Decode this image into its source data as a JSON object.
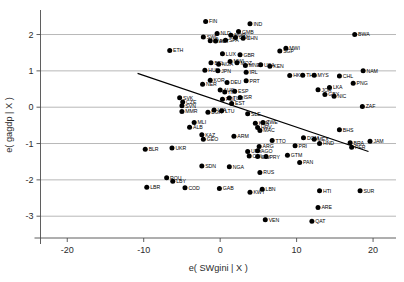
{
  "chart_data": {
    "type": "scatter",
    "title": "",
    "xlabel": "e( SWgini | X )",
    "ylabel": "e( gagdp | X )",
    "xlim": [
      -23.5,
      23.0
    ],
    "ylim": [
      -3.6,
      2.62
    ],
    "xticks": [
      -20,
      -10,
      0,
      10,
      20
    ],
    "xtick_labels": [
      "-20",
      "-10",
      "0",
      "10",
      "20"
    ],
    "yticks": [
      -3,
      -2,
      -1,
      0,
      1,
      2
    ],
    "ytick_labels": [
      "-3",
      "-2",
      "-1",
      "0",
      "1",
      "2"
    ],
    "grid": "horizontal",
    "legend": "none",
    "marker_color": "#000000",
    "fit_line": {
      "label": "linear fit",
      "x_start": -10.8,
      "y_start": 0.93,
      "x_end": 19.4,
      "y_end": -1.22,
      "color": "#000000"
    },
    "points": [
      {
        "label": "FIN",
        "x": -1.9,
        "y": 2.36
      },
      {
        "label": "IND",
        "x": 3.9,
        "y": 2.3
      },
      {
        "label": "NLD",
        "x": -0.4,
        "y": 2.03
      },
      {
        "label": "GMB",
        "x": 2.4,
        "y": 2.08
      },
      {
        "label": "NOR",
        "x": 1.4,
        "y": 1.98
      },
      {
        "label": "SWE",
        "x": -2.2,
        "y": 1.93
      },
      {
        "label": "CAN",
        "x": 2.0,
        "y": 1.92
      },
      {
        "label": "CHN",
        "x": 3.0,
        "y": 1.9
      },
      {
        "label": "DNK",
        "x": -1.3,
        "y": 1.83
      },
      {
        "label": "AUT",
        "x": -0.6,
        "y": 1.82
      },
      {
        "label": "SPA",
        "x": 0.7,
        "y": 1.84
      },
      {
        "label": "ETH",
        "x": -6.6,
        "y": 1.56
      },
      {
        "label": "LUX",
        "x": 0.3,
        "y": 1.47
      },
      {
        "label": "GBR",
        "x": 2.6,
        "y": 1.44
      },
      {
        "label": "MWI",
        "x": 8.6,
        "y": 1.62
      },
      {
        "label": "SGP",
        "x": 7.8,
        "y": 1.55
      },
      {
        "label": "BWA",
        "x": 17.6,
        "y": 2.0
      },
      {
        "label": "BEL",
        "x": -1.2,
        "y": 1.22
      },
      {
        "label": "NGA2",
        "x": -0.2,
        "y": 1.18
      },
      {
        "label": "MWI2",
        "x": 1.3,
        "y": 1.26
      },
      {
        "label": "MOZ",
        "x": 2.2,
        "y": 1.22
      },
      {
        "label": "MNE",
        "x": 3.3,
        "y": 1.15
      },
      {
        "label": "USA",
        "x": 5.3,
        "y": 1.17
      },
      {
        "label": "KEN",
        "x": 6.5,
        "y": 1.13
      },
      {
        "label": "HUN",
        "x": -2.0,
        "y": 1.02
      },
      {
        "label": "JPN",
        "x": -0.3,
        "y": 1.0
      },
      {
        "label": "IRL",
        "x": 3.4,
        "y": 0.96
      },
      {
        "label": "NAM",
        "x": 18.7,
        "y": 1.0
      },
      {
        "label": "HKG",
        "x": 9.1,
        "y": 0.87
      },
      {
        "label": "THA",
        "x": 10.8,
        "y": 0.88
      },
      {
        "label": "MYS",
        "x": 12.3,
        "y": 0.88
      },
      {
        "label": "CHL",
        "x": 15.6,
        "y": 0.86
      },
      {
        "label": "PNG",
        "x": 17.4,
        "y": 0.66
      },
      {
        "label": "KOR",
        "x": -1.3,
        "y": 0.74
      },
      {
        "label": "NER",
        "x": -2.3,
        "y": 0.63
      },
      {
        "label": "DEU",
        "x": 0.9,
        "y": 0.68
      },
      {
        "label": "PRT",
        "x": 3.4,
        "y": 0.73
      },
      {
        "label": "SVK",
        "x": -5.3,
        "y": 0.26
      },
      {
        "label": "CZE",
        "x": -4.9,
        "y": 0.14
      },
      {
        "label": "SVN",
        "x": -5.0,
        "y": 0.04
      },
      {
        "label": "MMR",
        "x": -5.0,
        "y": -0.12
      },
      {
        "label": "AUS",
        "x": 0.0,
        "y": 0.47
      },
      {
        "label": "ITA",
        "x": 0.6,
        "y": 0.42
      },
      {
        "label": "ESP",
        "x": 1.9,
        "y": 0.44
      },
      {
        "label": "JOR",
        "x": 12.8,
        "y": 0.48
      },
      {
        "label": "LKA",
        "x": 14.3,
        "y": 0.54
      },
      {
        "label": "GBY",
        "x": 13.7,
        "y": 0.35
      },
      {
        "label": "NIC",
        "x": 14.9,
        "y": 0.3
      },
      {
        "label": "ISR",
        "x": 2.6,
        "y": 0.27
      },
      {
        "label": "TUR",
        "x": 1.2,
        "y": 0.25
      },
      {
        "label": "POL",
        "x": 0.3,
        "y": 0.22
      },
      {
        "label": "EST",
        "x": 1.5,
        "y": 0.1
      },
      {
        "label": "ZAF",
        "x": 18.6,
        "y": 0.02
      },
      {
        "label": "LVA",
        "x": -0.8,
        "y": -0.08
      },
      {
        "label": "LTU",
        "x": 0.2,
        "y": -0.1
      },
      {
        "label": "SLE",
        "x": 3.6,
        "y": -0.18
      },
      {
        "label": "BGR",
        "x": -1.6,
        "y": -0.14
      },
      {
        "label": "MLI",
        "x": -3.4,
        "y": -0.42
      },
      {
        "label": "ALB",
        "x": -4.0,
        "y": -0.55
      },
      {
        "label": "KEN2",
        "x": 4.6,
        "y": -0.44
      },
      {
        "label": "ZWE",
        "x": 5.6,
        "y": -0.42
      },
      {
        "label": "HRV",
        "x": 4.9,
        "y": -0.56
      },
      {
        "label": "MAC",
        "x": 5.2,
        "y": -0.64
      },
      {
        "label": "KAZ",
        "x": -2.4,
        "y": -0.76
      },
      {
        "label": "GEO",
        "x": -2.2,
        "y": -0.88
      },
      {
        "label": "ARM",
        "x": 1.8,
        "y": -0.8
      },
      {
        "label": "BHS",
        "x": 15.6,
        "y": -0.62
      },
      {
        "label": "MEX",
        "x": 12.3,
        "y": -0.88
      },
      {
        "label": "HND",
        "x": 13.0,
        "y": -1.0
      },
      {
        "label": "BRA",
        "x": 17.0,
        "y": -0.98
      },
      {
        "label": "PER",
        "x": 17.2,
        "y": -1.1
      },
      {
        "label": "JAM",
        "x": 19.6,
        "y": -0.94
      },
      {
        "label": "TTO",
        "x": 6.8,
        "y": -0.92
      },
      {
        "label": "DOM",
        "x": 10.9,
        "y": -0.84
      },
      {
        "label": "ARG",
        "x": 5.1,
        "y": -1.08
      },
      {
        "label": "PRI",
        "x": 9.8,
        "y": -1.06
      },
      {
        "label": "URY",
        "x": 3.6,
        "y": -1.22
      },
      {
        "label": "AGO",
        "x": 4.9,
        "y": -1.2
      },
      {
        "label": "COL",
        "x": 3.8,
        "y": -1.34
      },
      {
        "label": "SLV",
        "x": 4.9,
        "y": -1.36
      },
      {
        "label": "PRY",
        "x": 6.0,
        "y": -1.36
      },
      {
        "label": "GTM",
        "x": 8.8,
        "y": -1.32
      },
      {
        "label": "BLR",
        "x": -9.8,
        "y": -1.16
      },
      {
        "label": "UKR",
        "x": -6.3,
        "y": -1.12
      },
      {
        "label": "PAN",
        "x": 10.4,
        "y": -1.52
      },
      {
        "label": "SDN",
        "x": -2.4,
        "y": -1.62
      },
      {
        "label": "NGA",
        "x": 1.2,
        "y": -1.64
      },
      {
        "label": "RUS",
        "x": 5.2,
        "y": -1.8
      },
      {
        "label": "ROU",
        "x": -7.0,
        "y": -1.94
      },
      {
        "label": "LBY",
        "x": -6.2,
        "y": -2.04
      },
      {
        "label": "LBR",
        "x": -9.6,
        "y": -2.2
      },
      {
        "label": "COD",
        "x": -4.6,
        "y": -2.22
      },
      {
        "label": "GAB",
        "x": -0.1,
        "y": -2.24
      },
      {
        "label": "KWT",
        "x": 3.9,
        "y": -2.34
      },
      {
        "label": "LBN",
        "x": 5.5,
        "y": -2.26
      },
      {
        "label": "HTI",
        "x": 13.0,
        "y": -2.3
      },
      {
        "label": "SUR",
        "x": 18.3,
        "y": -2.3
      },
      {
        "label": "ARE",
        "x": 12.8,
        "y": -2.76
      },
      {
        "label": "VEN",
        "x": 5.9,
        "y": -3.1
      },
      {
        "label": "QAT",
        "x": 12.0,
        "y": -3.14
      }
    ]
  }
}
